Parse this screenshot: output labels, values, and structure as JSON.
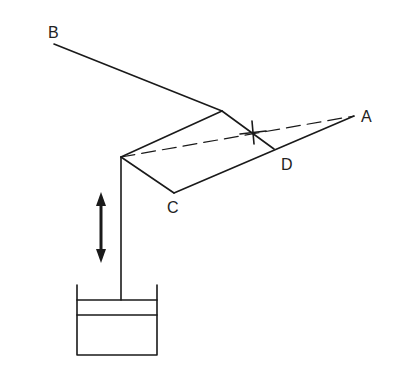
{
  "diagram": {
    "type": "mechanism-linkage",
    "stroke_color": "#1a1a1a",
    "labels": {
      "A": "A",
      "B": "B",
      "C": "C",
      "D": "D"
    },
    "points": {
      "B": [
        54,
        44
      ],
      "joint_top": [
        222,
        111
      ],
      "pivot_left": [
        121,
        157
      ],
      "C": [
        174,
        193
      ],
      "D": [
        274,
        149
      ],
      "A": [
        354,
        116
      ],
      "cross": [
        253,
        132
      ]
    },
    "elements": [
      {
        "id": "link-B",
        "from": "B",
        "to": "joint_top",
        "style": "solid"
      },
      {
        "id": "link-top",
        "from": "pivot_left",
        "to": "joint_top",
        "style": "solid"
      },
      {
        "id": "link-joint-D",
        "from": "joint_top",
        "to": "D",
        "style": "solid"
      },
      {
        "id": "link-pivot-C",
        "from": "pivot_left",
        "to": "C",
        "style": "solid"
      },
      {
        "id": "link-C-A",
        "from": "C",
        "to": "A",
        "style": "solid"
      },
      {
        "id": "line-dashed",
        "from": "pivot_left",
        "to": "A",
        "style": "dashed"
      },
      {
        "id": "rod",
        "from": "pivot_left",
        "to": [
          121,
          300
        ],
        "style": "solid"
      }
    ],
    "cylinder": {
      "left": 77,
      "right": 157,
      "top": 285,
      "piston_top": 300,
      "piston_bottom": 315,
      "bottom": 355
    },
    "motion_arrow": {
      "x": 101,
      "y1": 192,
      "y2": 263,
      "direction": "bidirectional-vertical"
    }
  }
}
